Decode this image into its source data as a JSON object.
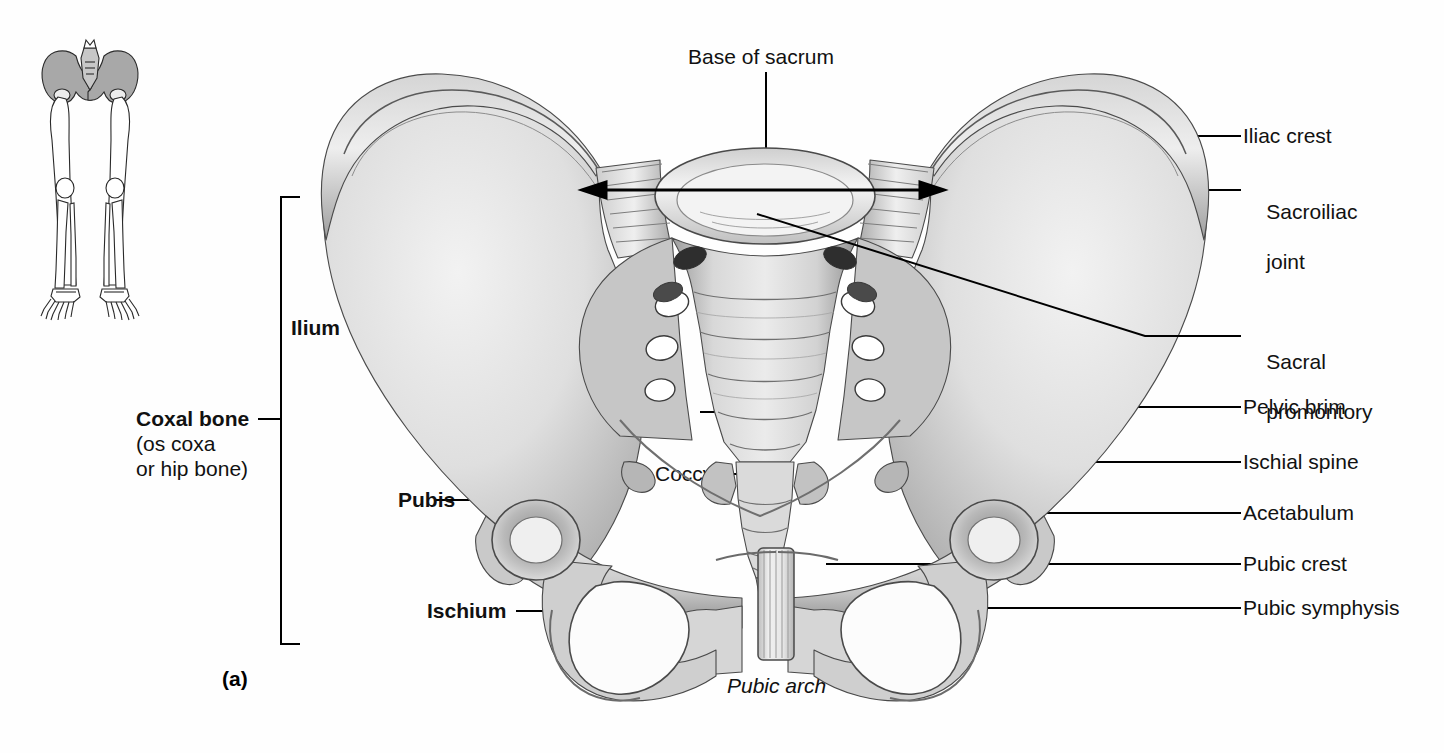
{
  "figure": {
    "caption": "(a)",
    "view": "Anterior view of the male pelvis / pelvic girdle",
    "background_color": "#fefefe",
    "line_color": "#000000",
    "bone_fill": "#dcdcdc",
    "bone_shadow": "#6e6e6e"
  },
  "thumbnail": {
    "name": "lower-limb-skeleton-orientation-thumbnail",
    "highlight_region": "pelvis",
    "highlight_color": "#a8a8a8"
  },
  "labels": {
    "top": [
      {
        "text": "Base of sacrum",
        "style": "plain"
      }
    ],
    "left": [
      {
        "text": "Ilium",
        "style": "bold"
      },
      {
        "text": "Coxal bone",
        "style": "bold"
      },
      {
        "text": "(os coxa",
        "style": "plain"
      },
      {
        "text": "or hip bone)",
        "style": "plain"
      },
      {
        "text": "Pubis",
        "style": "bold"
      },
      {
        "text": "Ischium",
        "style": "bold"
      }
    ],
    "center": [
      {
        "text": "Sacrum",
        "style": "plain"
      },
      {
        "text": "Coccyx",
        "style": "plain"
      },
      {
        "text": "Pubic arch",
        "style": "italic"
      }
    ],
    "overlay": [
      {
        "text": "Iliac fossa",
        "style": "italic"
      }
    ],
    "right": [
      {
        "text": "Iliac crest",
        "style": "plain"
      },
      {
        "text": "Sacroiliac",
        "style": "plain"
      },
      {
        "text": "joint",
        "style": "plain"
      },
      {
        "text": "Sacral",
        "style": "plain"
      },
      {
        "text": "promontory",
        "style": "plain"
      },
      {
        "text": "Pelvic brim",
        "style": "plain"
      },
      {
        "text": "Ischial spine",
        "style": "plain"
      },
      {
        "text": "Acetabulum",
        "style": "plain"
      },
      {
        "text": "Pubic crest",
        "style": "plain"
      },
      {
        "text": "Pubic symphysis",
        "style": "plain"
      }
    ]
  },
  "annotations": {
    "measurement_arrow": "double-headed arrow across sacroiliac joints"
  }
}
